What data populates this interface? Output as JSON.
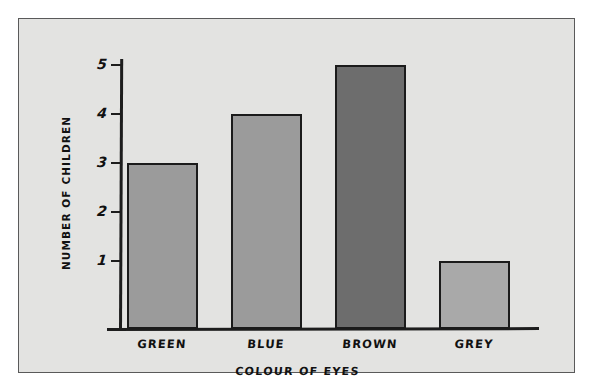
{
  "chart_data": {
    "type": "bar",
    "title": "",
    "categories": [
      "GREEN",
      "BLUE",
      "BROWN",
      "GREY"
    ],
    "values": [
      3,
      4,
      5,
      1
    ],
    "xlabel": "COLOUR OF EYES",
    "ylabel": "NUMBER OF CHILDREN",
    "ylim": [
      0,
      5.5
    ],
    "ytick_labels": [
      "1",
      "2",
      "3",
      "4",
      "5"
    ],
    "ytick_values": [
      1,
      2,
      3,
      4,
      5
    ],
    "grid": false,
    "legend": false,
    "bar_colors": [
      "#9b9b9b",
      "#9b9b9b",
      "#6d6d6d",
      "#a9a9a9"
    ],
    "bar_outline_color": "#1b1b1b",
    "axis_color": "#1d1d1d",
    "plot_background": "#e3e3e1",
    "page_background": "#ffffff",
    "frame_color": "#5a5a5a"
  },
  "figure": {
    "caption": ""
  }
}
